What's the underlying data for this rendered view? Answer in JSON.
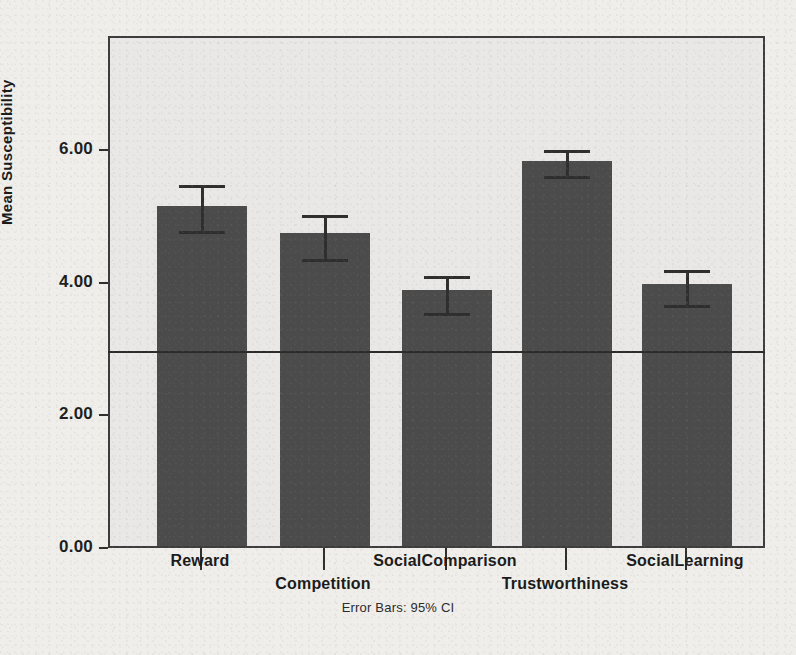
{
  "chart_data": {
    "type": "bar",
    "title": "",
    "xlabel": "",
    "ylabel": "Mean Susceptibility",
    "categories": [
      "Reward",
      "Competition",
      "SocialComparison",
      "Trustworthiness",
      "SocialLearning"
    ],
    "values": [
      5.13,
      4.72,
      3.86,
      5.81,
      3.95
    ],
    "error_low": [
      4.77,
      4.34,
      3.53,
      5.6,
      3.65
    ],
    "error_high": [
      5.51,
      5.05,
      4.13,
      6.03,
      4.22
    ],
    "error_type": "95% CI",
    "ylim": [
      0.0,
      7.72
    ],
    "ytick_labels": [
      "0.00",
      "2.00",
      "4.00",
      "6.00"
    ],
    "ytick_values": [
      0.0,
      2.0,
      4.0,
      6.0
    ],
    "reference_line": 3.0,
    "grid": false,
    "legend": "none",
    "bar_color": "#4b4b4b",
    "plot_background": "#e9e8e6",
    "footnote": "Error Bars: 95% CI"
  },
  "axis": {
    "y_title": "Mean Susceptibility"
  },
  "ghost": {
    "top": "",
    "bottom1": "",
    "bottom2": "",
    "bottom3": ""
  }
}
